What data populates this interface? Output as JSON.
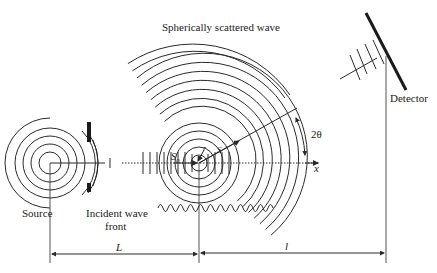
{
  "diagram": {
    "type": "scattering-geometry",
    "labels": {
      "source": "Source",
      "incident_wave_front_line1": "Incident wave",
      "incident_wave_front_line2": "front",
      "scattered_wave": "Spherically scattered wave",
      "detector": "Detector",
      "angle": "2θ",
      "x_axis": "x",
      "s0": "S",
      "s0_sub": "0",
      "s": "S",
      "r": "r",
      "distance_L": "L",
      "distance_l": "l"
    },
    "colors": {
      "line": "#2a2a2a",
      "background": "#ffffff"
    }
  }
}
